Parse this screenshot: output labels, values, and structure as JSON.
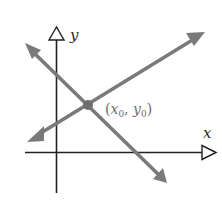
{
  "diagram": {
    "type": "coordinate-plane-intersecting-lines",
    "axes": {
      "x_label": "x",
      "y_label": "y",
      "axis_color": "#222222"
    },
    "lines": [
      {
        "name": "rising-line",
        "color": "#7a7a7a"
      },
      {
        "name": "falling-line",
        "color": "#7a7a7a"
      }
    ],
    "intersection": {
      "label_open": "(",
      "x_var": "x",
      "x_sub": "0",
      "separator": ", ",
      "y_var": "y",
      "y_sub": "0",
      "label_close": ")",
      "color": "#6e6e6e"
    }
  }
}
